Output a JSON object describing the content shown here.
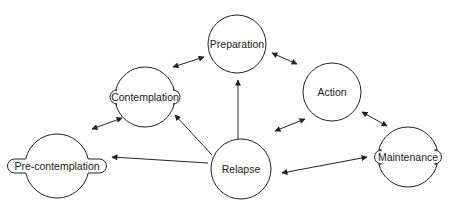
{
  "diagram": {
    "type": "stages-of-change cycle",
    "stroke_color": "#222222",
    "background": "#ffffff",
    "nodes": [
      {
        "id": "preparation",
        "label": "Preparation",
        "cx": 237,
        "cy": 44,
        "r": 29,
        "shape": "circle"
      },
      {
        "id": "contemplation",
        "label": "Contemplation",
        "cx": 145,
        "cy": 97,
        "r": 30,
        "shape": "circle-with-pill-label",
        "pill_w": 70
      },
      {
        "id": "action",
        "label": "Action",
        "cx": 332,
        "cy": 92,
        "r": 29,
        "shape": "circle"
      },
      {
        "id": "precontemplation",
        "label": "Pre-contemplation",
        "cx": 57,
        "cy": 166,
        "r": 32,
        "shape": "circle-with-pill-label",
        "pill_w": 99
      },
      {
        "id": "relapse",
        "label": "Relapse",
        "cx": 241,
        "cy": 169,
        "r": 30,
        "shape": "circle"
      },
      {
        "id": "maintenance",
        "label": "Maintenance",
        "cx": 408,
        "cy": 157,
        "r": 30,
        "shape": "circle-with-pill-label",
        "pill_w": 67
      }
    ],
    "edges": [
      {
        "from": "contemplation",
        "to": "preparation",
        "bidirectional": true,
        "x1": 173,
        "y1": 67,
        "x2": 204,
        "y2": 57
      },
      {
        "from": "preparation",
        "to": "action",
        "bidirectional": true,
        "x1": 272,
        "y1": 53,
        "x2": 297,
        "y2": 64
      },
      {
        "from": "precontemplation",
        "to": "contemplation",
        "bidirectional": true,
        "x1": 92,
        "y1": 129,
        "x2": 122,
        "y2": 118
      },
      {
        "from": "action",
        "to": "maintenance",
        "bidirectional": true,
        "x1": 362,
        "y1": 112,
        "x2": 387,
        "y2": 126
      },
      {
        "from": "relapse",
        "to": "action",
        "bidirectional": true,
        "x1": 275,
        "y1": 131,
        "x2": 305,
        "y2": 119
      },
      {
        "from": "relapse",
        "to": "maintenance",
        "bidirectional": true,
        "x1": 282,
        "y1": 173,
        "x2": 367,
        "y2": 157
      },
      {
        "from": "relapse",
        "to": "preparation",
        "bidirectional": false,
        "x1": 238,
        "y1": 139,
        "x2": 238,
        "y2": 80
      },
      {
        "from": "relapse",
        "to": "contemplation",
        "bidirectional": false,
        "x1": 212,
        "y1": 155,
        "x2": 175,
        "y2": 115
      },
      {
        "from": "relapse",
        "to": "precontemplation",
        "bidirectional": false,
        "x1": 208,
        "y1": 163,
        "x2": 112,
        "y2": 157
      }
    ]
  }
}
